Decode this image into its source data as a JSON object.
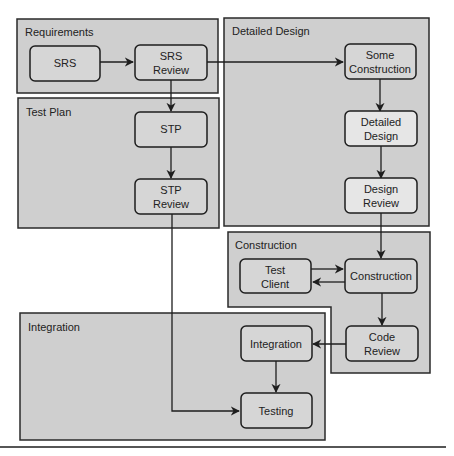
{
  "colors": {
    "background": "#ffffff",
    "group_fill": "#cfcfcf",
    "group_stroke": "#2a2a2a",
    "node_fill": "#d6d6d6",
    "node_fill_light": "#e6e6e6",
    "line": "#1e1e1e"
  },
  "groups": {
    "requirements": "Requirements",
    "detailed_design": "Detailed Design",
    "test_plan": "Test Plan",
    "construction": "Construction",
    "integration": "Integration"
  },
  "nodes": {
    "srs": [
      "SRS"
    ],
    "srs_review": [
      "SRS",
      "Review"
    ],
    "some_construction": [
      "Some",
      "Construction"
    ],
    "detailed_design": [
      "Detailed",
      "Design"
    ],
    "design_review": [
      "Design",
      "Review"
    ],
    "stp": [
      "STP"
    ],
    "stp_review": [
      "STP",
      "Review"
    ],
    "test_client": [
      "Test",
      "Client"
    ],
    "construction": [
      "Construction"
    ],
    "code_review": [
      "Code",
      "Review"
    ],
    "integration": [
      "Integration"
    ],
    "testing": [
      "Testing"
    ]
  }
}
